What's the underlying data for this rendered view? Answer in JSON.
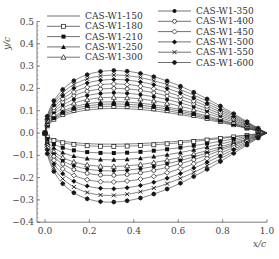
{
  "chart_data": {
    "type": "line",
    "title": "",
    "xlabel": "x/c",
    "ylabel": "y/c",
    "xlim": [
      0.0,
      1.0
    ],
    "ylim": [
      -0.4,
      0.5
    ],
    "xticks": [
      "0.0",
      "0.2",
      "0.4",
      "0.6",
      "0.8",
      "1.0"
    ],
    "yticks": [
      "0.5",
      "0.4",
      "0.3",
      "0.2",
      "0.1",
      "0.0",
      "-0.1",
      "-0.2",
      "-0.3",
      "-0.4"
    ],
    "grid": false,
    "legend_position": "top, two columns",
    "series": [
      {
        "name": "CAS-W1-150",
        "marker": "none",
        "upper_max": 0.11,
        "lower_min": -0.05
      },
      {
        "name": "CAS-W1-180",
        "marker": "open-square",
        "upper_max": 0.12,
        "lower_min": -0.06
      },
      {
        "name": "CAS-W1-210",
        "marker": "filled-square",
        "upper_max": 0.13,
        "lower_min": -0.09
      },
      {
        "name": "CAS-W1-250",
        "marker": "filled-triangle",
        "upper_max": 0.14,
        "lower_min": -0.12
      },
      {
        "name": "CAS-W1-300",
        "marker": "open-triangle",
        "upper_max": 0.16,
        "lower_min": -0.15
      },
      {
        "name": "CAS-W1-350",
        "marker": "filled-circle",
        "upper_max": 0.18,
        "lower_min": -0.17
      },
      {
        "name": "CAS-W1-400",
        "marker": "open-circle",
        "upper_max": 0.2,
        "lower_min": -0.19
      },
      {
        "name": "CAS-W1-450",
        "marker": "open-diamond",
        "upper_max": 0.22,
        "lower_min": -0.22
      },
      {
        "name": "CAS-W1-500",
        "marker": "filled-diamond",
        "upper_max": 0.24,
        "lower_min": -0.25
      },
      {
        "name": "CAS-W1-550",
        "marker": "cross",
        "upper_max": 0.26,
        "lower_min": -0.28
      },
      {
        "name": "CAS-W1-600",
        "marker": "filled-star",
        "upper_max": 0.28,
        "lower_min": -0.31
      }
    ]
  }
}
